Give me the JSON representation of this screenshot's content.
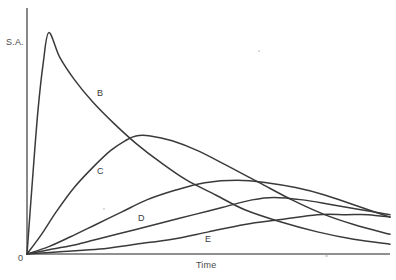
{
  "chart_data": {
    "type": "line",
    "title": "",
    "subtitle": "",
    "xlabel": "Time",
    "ylabel": "S.A.",
    "origin_label": "0",
    "grid": false,
    "legend_position": "inline-curve-labels",
    "axes": {
      "x_axis_visible": true,
      "y_axis_visible": true,
      "x_ticks": [],
      "y_ticks": [],
      "xlim": [
        0,
        100
      ],
      "ylim": [
        0,
        100
      ]
    },
    "annotation_note": "Five skewed unimodal curves all rising from the origin; peaks occur progressively later and lower from curve B through curve E.",
    "series": [
      {
        "name": "B",
        "label": "B",
        "label_x": 97,
        "label_y": 88,
        "peak_x": 6,
        "peak_y": 90,
        "color": "#3a3a3a",
        "points": [
          [
            0,
            0
          ],
          [
            1.5,
            30
          ],
          [
            3,
            58
          ],
          [
            4.5,
            78
          ],
          [
            6,
            90
          ],
          [
            9,
            80
          ],
          [
            13,
            71
          ],
          [
            18,
            62
          ],
          [
            24,
            53
          ],
          [
            30,
            45
          ],
          [
            37,
            37
          ],
          [
            44,
            30
          ],
          [
            52,
            24
          ],
          [
            60,
            18
          ],
          [
            70,
            13
          ],
          [
            80,
            9
          ],
          [
            90,
            6
          ],
          [
            100,
            4
          ]
        ]
      },
      {
        "name": "C",
        "label": "C",
        "label_x": 97,
        "label_y": 166,
        "peak_x": 30,
        "peak_y": 48,
        "color": "#3a3a3a",
        "points": [
          [
            0,
            0
          ],
          [
            4,
            8
          ],
          [
            8,
            17
          ],
          [
            13,
            27
          ],
          [
            18,
            35
          ],
          [
            23,
            42
          ],
          [
            27,
            46
          ],
          [
            30,
            48
          ],
          [
            34,
            48
          ],
          [
            40,
            46
          ],
          [
            47,
            42
          ],
          [
            55,
            36
          ],
          [
            64,
            29
          ],
          [
            73,
            22
          ],
          [
            82,
            16
          ],
          [
            90,
            12
          ],
          [
            100,
            8
          ]
        ]
      },
      {
        "name": "A",
        "label": "",
        "peak_x": 58,
        "peak_y": 30,
        "color": "#3a3a3a",
        "points": [
          [
            0,
            0
          ],
          [
            6,
            3
          ],
          [
            12,
            7
          ],
          [
            19,
            12
          ],
          [
            26,
            17
          ],
          [
            33,
            22
          ],
          [
            41,
            26
          ],
          [
            49,
            29
          ],
          [
            58,
            30
          ],
          [
            66,
            29
          ],
          [
            74,
            27
          ],
          [
            82,
            24
          ],
          [
            90,
            20
          ],
          [
            96,
            17
          ],
          [
            100,
            15
          ]
        ]
      },
      {
        "name": "D",
        "label": "D",
        "label_x": 138,
        "label_y": 213,
        "peak_x": 68,
        "peak_y": 23,
        "color": "#3a3a3a",
        "points": [
          [
            0,
            0
          ],
          [
            7,
            2
          ],
          [
            14,
            4
          ],
          [
            22,
            7
          ],
          [
            30,
            10
          ],
          [
            38,
            13
          ],
          [
            46,
            16
          ],
          [
            54,
            19
          ],
          [
            62,
            22
          ],
          [
            68,
            23
          ],
          [
            76,
            22
          ],
          [
            84,
            20
          ],
          [
            92,
            18
          ],
          [
            100,
            16
          ]
        ]
      },
      {
        "name": "E",
        "label": "E",
        "label_x": 205,
        "label_y": 234,
        "peak_x": 80,
        "peak_y": 16,
        "color": "#3a3a3a",
        "points": [
          [
            0,
            0
          ],
          [
            10,
            1
          ],
          [
            20,
            2
          ],
          [
            30,
            4
          ],
          [
            40,
            6
          ],
          [
            50,
            9
          ],
          [
            60,
            12
          ],
          [
            70,
            14
          ],
          [
            80,
            16
          ],
          [
            88,
            16
          ],
          [
            94,
            16
          ],
          [
            100,
            15
          ]
        ]
      }
    ]
  }
}
